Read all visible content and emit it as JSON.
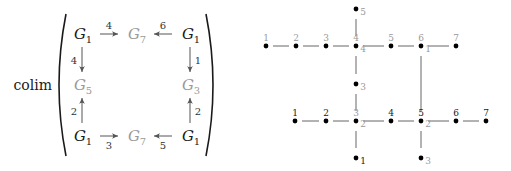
{
  "colors": {
    "black": "#1a1a1a",
    "grey": "#9a9a9a",
    "edge": "#666666",
    "arrow": "#555555"
  },
  "left_diagram": {
    "operator": "colim",
    "nodes": [
      {
        "id": "tl",
        "base": "G",
        "sub": "1",
        "x": 82,
        "y": 34,
        "color": "black"
      },
      {
        "id": "tm",
        "base": "G",
        "sub": "7",
        "x": 136,
        "y": 34,
        "color": "grey"
      },
      {
        "id": "tr",
        "base": "G",
        "sub": "1",
        "x": 190,
        "y": 34,
        "color": "black"
      },
      {
        "id": "ml",
        "base": "G",
        "sub": "5",
        "x": 82,
        "y": 85,
        "color": "grey"
      },
      {
        "id": "mr",
        "base": "G",
        "sub": "3",
        "x": 190,
        "y": 85,
        "color": "grey"
      },
      {
        "id": "bl",
        "base": "G",
        "sub": "1",
        "x": 82,
        "y": 136,
        "color": "black"
      },
      {
        "id": "bm",
        "base": "G",
        "sub": "7",
        "x": 136,
        "y": 136,
        "color": "grey"
      },
      {
        "id": "br",
        "base": "G",
        "sub": "1",
        "x": 190,
        "y": 136,
        "color": "black"
      }
    ],
    "arrows": [
      {
        "from": "tl",
        "to": "tm",
        "label": "4",
        "label_pos": "above"
      },
      {
        "from": "tr",
        "to": "tm",
        "label": "6",
        "label_pos": "above"
      },
      {
        "from": "tl",
        "to": "ml",
        "label": "4",
        "label_pos": "left"
      },
      {
        "from": "tr",
        "to": "mr",
        "label": "1",
        "label_pos": "right"
      },
      {
        "from": "bl",
        "to": "ml",
        "label": "2",
        "label_pos": "left"
      },
      {
        "from": "br",
        "to": "mr",
        "label": "2",
        "label_pos": "right"
      },
      {
        "from": "bl",
        "to": "bm",
        "label": "3",
        "label_pos": "below"
      },
      {
        "from": "br",
        "to": "bm",
        "label": "5",
        "label_pos": "below"
      }
    ]
  },
  "right_graph": {
    "nodes": [
      {
        "id": "a1",
        "x": 266,
        "y": 46,
        "top": "1",
        "top_color": "grey"
      },
      {
        "id": "a2",
        "x": 296,
        "y": 46,
        "top": "2",
        "top_color": "grey"
      },
      {
        "id": "a3",
        "x": 326,
        "y": 46,
        "top": "3",
        "top_color": "grey"
      },
      {
        "id": "a4",
        "x": 356,
        "y": 46,
        "top": "4",
        "top_color": "grey",
        "sub": "4",
        "sub_color": "grey"
      },
      {
        "id": "a5",
        "x": 391,
        "y": 46,
        "top": "5",
        "top_color": "grey"
      },
      {
        "id": "a6",
        "x": 421,
        "y": 46,
        "top": "6",
        "top_color": "grey",
        "sub": "1",
        "sub_color": "grey"
      },
      {
        "id": "a7",
        "x": 456,
        "y": 46,
        "top": "7",
        "top_color": "grey"
      },
      {
        "id": "u5",
        "x": 356,
        "y": 9,
        "sub": "5",
        "sub_color": "grey"
      },
      {
        "id": "u3",
        "x": 356,
        "y": 84,
        "sub": "3",
        "sub_color": "grey"
      },
      {
        "id": "b1",
        "x": 295,
        "y": 121,
        "top": "1",
        "top_color": "black"
      },
      {
        "id": "b2",
        "x": 326,
        "y": 121,
        "top": "2",
        "top_color": "black"
      },
      {
        "id": "b3",
        "x": 356,
        "y": 121,
        "top": "3",
        "top_color": "grey",
        "sub": "2",
        "sub_color": "grey"
      },
      {
        "id": "b4",
        "x": 391,
        "y": 121,
        "top": "4",
        "top_color": "black"
      },
      {
        "id": "b5",
        "x": 421,
        "y": 121,
        "top": "5",
        "top_color": "black",
        "sub": "2",
        "sub_color": "grey"
      },
      {
        "id": "b6",
        "x": 456,
        "y": 121,
        "top": "6",
        "top_color": "black"
      },
      {
        "id": "b7",
        "x": 486,
        "y": 121,
        "top": "7",
        "top_color": "black"
      },
      {
        "id": "d1",
        "x": 356,
        "y": 158,
        "sub": "1",
        "sub_color": "black"
      },
      {
        "id": "d3",
        "x": 421,
        "y": 158,
        "sub": "3",
        "sub_color": "grey"
      }
    ],
    "edges": [
      [
        "a1",
        "a2"
      ],
      [
        "a2",
        "a3"
      ],
      [
        "a3",
        "a4"
      ],
      [
        "a4",
        "a5"
      ],
      [
        "a5",
        "a6"
      ],
      [
        "a6",
        "a7"
      ],
      [
        "u5",
        "a4"
      ],
      [
        "a4",
        "u3"
      ],
      [
        "a6",
        "b5"
      ],
      [
        "b1",
        "b2"
      ],
      [
        "b2",
        "b3"
      ],
      [
        "b3",
        "b4"
      ],
      [
        "b4",
        "b5"
      ],
      [
        "b5",
        "b6"
      ],
      [
        "b6",
        "b7"
      ],
      [
        "u3",
        "b3"
      ],
      [
        "b3",
        "d1"
      ],
      [
        "b5",
        "d3"
      ]
    ]
  }
}
